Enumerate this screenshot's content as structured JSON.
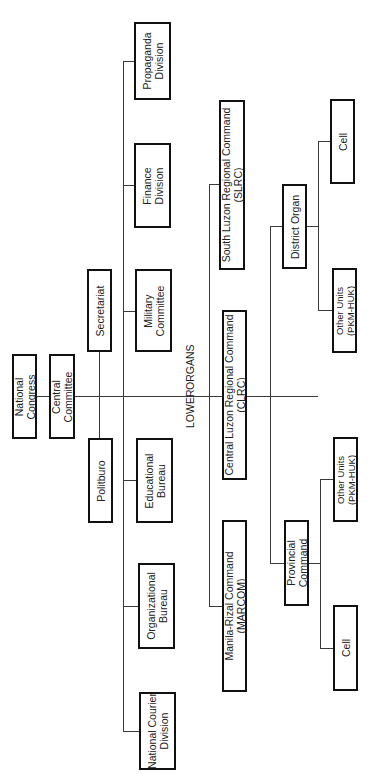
{
  "diagram": {
    "type": "org-chart",
    "orientation": "rotated -90deg",
    "top": {
      "national_congress": {
        "line1": "National",
        "line2": "Congress"
      },
      "central_committee": {
        "line1": "Central",
        "line2": "Committee"
      },
      "secretariat": {
        "line1": "Secretariat"
      },
      "politburo": {
        "line1": "Politburo"
      }
    },
    "departments": [
      {
        "line1": "Propaganda",
        "line2": "Division"
      },
      {
        "line1": "Finance",
        "line2": "Division"
      },
      {
        "line1": "Military",
        "line2": "Committee"
      },
      {
        "line1": "Educational",
        "line2": "Bureau"
      },
      {
        "line1": "Organizational",
        "line2": "Bureau"
      },
      {
        "line1": "National Courier",
        "line2": "Division"
      }
    ],
    "lower_organs_label": {
      "word1": "LOWER",
      "word2": "ORGANS"
    },
    "regional_commands": [
      {
        "line1": "South Luzon Regional Command",
        "line2": "(SLRC)"
      },
      {
        "line1": "Central Luzon Regional Command",
        "line2": "(CLRC)"
      },
      {
        "line1": "Manila-Rizal Command",
        "line2": "(MARCOM)"
      }
    ],
    "sub_organs": {
      "district_organ": {
        "line1": "District Organ"
      },
      "provincial_command": {
        "line1": "Provincial",
        "line2": "Command"
      }
    },
    "units": [
      {
        "line1": "Cell"
      },
      {
        "line1": "Other Units",
        "line2": "(PKM-HUK)"
      },
      {
        "line1": "Other Units",
        "line2": "(PKM-HUK)"
      },
      {
        "line1": "Cell"
      }
    ]
  }
}
